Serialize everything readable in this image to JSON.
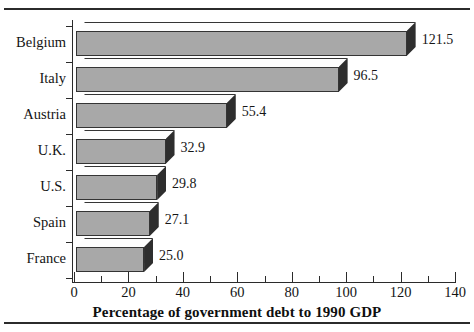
{
  "chart_data": {
    "type": "bar",
    "orientation": "horizontal",
    "title": "",
    "xlabel": "Percentage of government debt to 1990 GDP",
    "ylabel": "",
    "xlim": [
      0,
      140
    ],
    "xticks": [
      0,
      20,
      40,
      60,
      80,
      100,
      120,
      140
    ],
    "xtick_labels": [
      "0",
      "20",
      "40",
      "60",
      "80",
      "100",
      "120",
      "140"
    ],
    "minor_tick_step": 10,
    "grid": false,
    "legend": null,
    "categories": [
      "Belgium",
      "Italy",
      "Austria",
      "U.K.",
      "U.S.",
      "Spain",
      "France"
    ],
    "values": [
      121.5,
      96.5,
      55.4,
      32.9,
      29.8,
      27.1,
      25.0
    ],
    "data_labels": [
      "121.5",
      "96.5",
      "55.4",
      "32.9",
      "29.8",
      "27.1",
      "25.0"
    ],
    "bar_style": "3d-isometric",
    "colors": {
      "bar_face": "#a8a8a8",
      "bar_top": "#fdfdfd",
      "bar_side": "#2e2e2e",
      "outline": "#343434",
      "axis": "#2b2b2b",
      "text": "#141414",
      "background": "#ffffff"
    }
  }
}
